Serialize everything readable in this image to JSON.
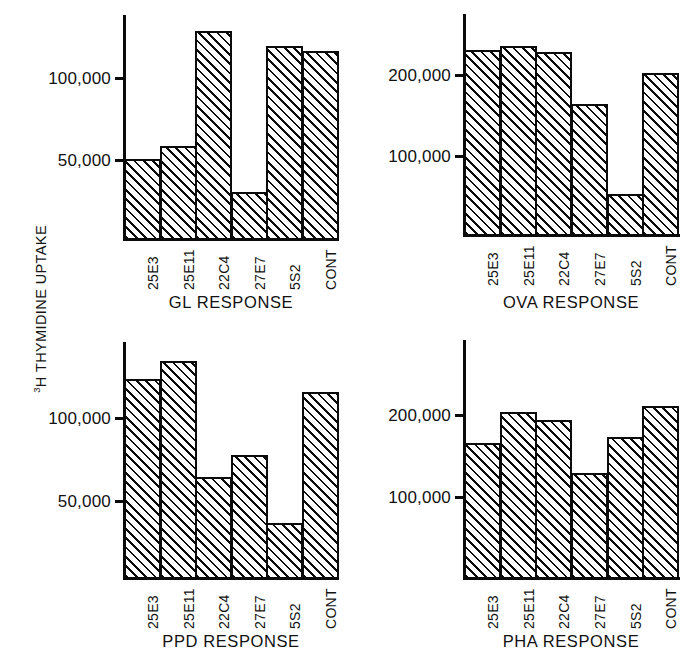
{
  "figure": {
    "y_axis_label_prefix": "3",
    "y_axis_label": "H THYMIDINE UPTAKE"
  },
  "chart_data": [
    {
      "type": "bar",
      "title": "GL RESPONSE",
      "xlabel": "",
      "ylabel": "3H THYMIDINE UPTAKE",
      "categories": [
        "25E3",
        "25E11",
        "22C4",
        "27E7",
        "5S2",
        "CONT"
      ],
      "values": [
        50000,
        58000,
        128000,
        30000,
        119000,
        116000
      ],
      "ticks": [
        {
          "label": "100,000",
          "value": 100000
        },
        {
          "label": "50,000",
          "value": 50000
        }
      ],
      "ylim": [
        0,
        138000
      ],
      "grid": false,
      "legend": "none"
    },
    {
      "type": "bar",
      "title": "OVA RESPONSE",
      "xlabel": "",
      "ylabel": "3H THYMIDINE UPTAKE",
      "categories": [
        "25E3",
        "25E11",
        "22C4",
        "27E7",
        "5S2",
        "CONT"
      ],
      "values": [
        230000,
        234000,
        227000,
        163000,
        52000,
        201000
      ],
      "ticks": [
        {
          "label": "200,000",
          "value": 200000
        },
        {
          "label": "100,000",
          "value": 100000
        }
      ],
      "ylim": [
        0,
        272000
      ],
      "grid": false,
      "legend": "none"
    },
    {
      "type": "bar",
      "title": "PPD RESPONSE",
      "xlabel": "",
      "ylabel": "3H THYMIDINE UPTAKE",
      "categories": [
        "25E3",
        "25E11",
        "22C4",
        "27E7",
        "5S2",
        "CONT"
      ],
      "values": [
        123000,
        134000,
        64000,
        77000,
        36000,
        115000
      ],
      "ticks": [
        {
          "label": "100,000",
          "value": 100000
        },
        {
          "label": "50,000",
          "value": 50000
        }
      ],
      "ylim": [
        0,
        145000
      ],
      "grid": false,
      "legend": "none"
    },
    {
      "type": "bar",
      "title": "PHA RESPONSE",
      "xlabel": "",
      "ylabel": "3H THYMIDINE UPTAKE",
      "categories": [
        "25E3",
        "25E11",
        "22C4",
        "27E7",
        "5S2",
        "CONT"
      ],
      "values": [
        165000,
        203000,
        193000,
        128000,
        172000,
        210000
      ],
      "ticks": [
        {
          "label": "200,000",
          "value": 200000
        },
        {
          "label": "100,000",
          "value": 100000
        }
      ],
      "ylim": [
        0,
        290000
      ],
      "grid": false,
      "legend": "none"
    }
  ],
  "layout": {
    "panels": [
      {
        "key": "gl",
        "left": 0,
        "top": 0,
        "axis_x": 123,
        "baseline_y": 238,
        "bar_left": 124,
        "bar_right": 337,
        "tick_px": [
          77,
          159
        ],
        "title_cx": 231,
        "title_y": 294
      },
      {
        "key": "ova",
        "left": 0,
        "top": 0,
        "axis_x": 463,
        "baseline_y": 234,
        "bar_left": 464,
        "bar_right": 678,
        "tick_px": [
          74,
          155
        ],
        "title_cx": 571,
        "title_y": 294
      },
      {
        "key": "ppd",
        "left": 0,
        "top": 0,
        "axis_x": 123,
        "baseline_y": 577,
        "bar_left": 124,
        "bar_right": 337,
        "tick_px": [
          417,
          500
        ],
        "title_cx": 231,
        "title_y": 633
      },
      {
        "key": "pha",
        "left": 0,
        "top": 0,
        "axis_x": 463,
        "baseline_y": 577,
        "bar_left": 464,
        "bar_right": 678,
        "tick_px": [
          414,
          496
        ],
        "title_cx": 571,
        "title_y": 633
      }
    ]
  }
}
